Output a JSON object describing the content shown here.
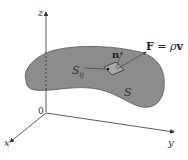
{
  "diagram": {
    "axes": {
      "z_label": "z",
      "y_label": "y",
      "x_label": "x",
      "origin_label": "0"
    },
    "surface_label": "S",
    "patch_label": "S",
    "patch_subscript": "ij",
    "normal_label": "n",
    "field_label_F": "F",
    "field_label_eq": " = ",
    "field_label_rho": "ρ",
    "field_label_v": "v",
    "colors": {
      "surface_fill": "#8a8a8a",
      "surface_stroke": "#555555",
      "axis": "#333333",
      "background": "#ffffff"
    }
  }
}
